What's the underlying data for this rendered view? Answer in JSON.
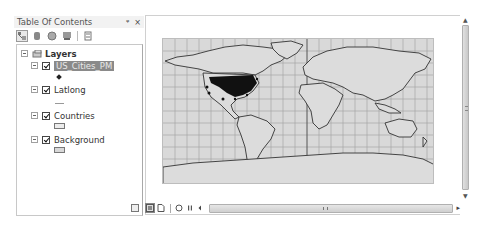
{
  "toc": {
    "title": "Table Of Contents",
    "header_buttons": {
      "pin": "ᵠ",
      "close": "×"
    },
    "toolbar": [
      {
        "name": "list-by-drawing-order",
        "active": true
      },
      {
        "name": "list-by-source",
        "active": false
      },
      {
        "name": "list-by-visibility",
        "active": false
      },
      {
        "name": "list-by-selection",
        "active": false
      },
      {
        "name": "options",
        "active": false
      }
    ],
    "root": {
      "label": "Layers",
      "expanded": true
    },
    "layers": [
      {
        "label": "US_Cities_PM",
        "checked": true,
        "selected": true,
        "symbol": "point"
      },
      {
        "label": "Latlong",
        "checked": true,
        "selected": false,
        "symbol": "line"
      },
      {
        "label": "Countries",
        "checked": true,
        "selected": false,
        "symbol": "polygon"
      },
      {
        "label": "Background",
        "checked": true,
        "selected": false,
        "symbol": "polygon"
      }
    ]
  },
  "map": {
    "background_color": "#d9d9d9",
    "graticule_color": "#a8a8a8",
    "land_outline_color": "#333333",
    "cities_color": "#111111"
  },
  "bottom_bar": {
    "buttons": [
      "data-view",
      "layout-view",
      "refresh",
      "pause",
      "scroll-left"
    ],
    "scroll_grip": "III",
    "scroll_right": "▸"
  },
  "vscroll": {
    "up": "▲",
    "down": "▼"
  }
}
